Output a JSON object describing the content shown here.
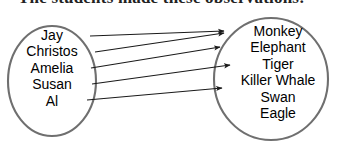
{
  "title": "The students made these observations:",
  "diagram": {
    "type": "mapping-diagram",
    "stroke_color": "#6f6f6f",
    "arrow_color": "#1a1a1a",
    "text_color": "#000000",
    "background": "#ffffff",
    "left_set": {
      "name": "students",
      "items": [
        {
          "label": "Jay"
        },
        {
          "label": "Christos"
        },
        {
          "label": "Amelia"
        },
        {
          "label": "Susan"
        },
        {
          "label": "Al"
        }
      ]
    },
    "right_set": {
      "name": "animals",
      "items": [
        {
          "label": "Monkey"
        },
        {
          "label": "Elephant"
        },
        {
          "label": "Tiger"
        },
        {
          "label": "Killer Whale"
        },
        {
          "label": "Swan"
        },
        {
          "label": "Eagle"
        }
      ]
    },
    "arrows": [
      {
        "from": "Jay",
        "to": "Monkey",
        "x1": 90,
        "y1": 36,
        "x2": 226,
        "y2": 31
      },
      {
        "from": "Christos",
        "to": "Monkey",
        "x1": 95,
        "y1": 52,
        "x2": 226,
        "y2": 33
      },
      {
        "from": "Amelia",
        "to": "Elephant",
        "x1": 91,
        "y1": 68,
        "x2": 222,
        "y2": 47
      },
      {
        "from": "Susan",
        "to": "Tiger",
        "x1": 92,
        "y1": 84,
        "x2": 232,
        "y2": 65
      },
      {
        "from": "Al",
        "to": "Killer Whale",
        "x1": 87,
        "y1": 100,
        "x2": 224,
        "y2": 88
      }
    ]
  }
}
